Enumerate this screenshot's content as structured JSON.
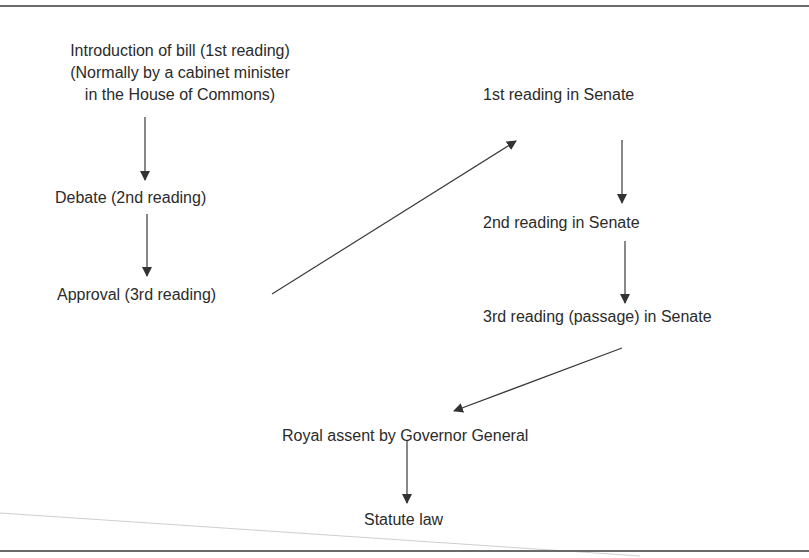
{
  "diagram": {
    "type": "flowchart",
    "nodes": {
      "intro": {
        "line1": "Introduction of bill (1st reading)",
        "line2": "(Normally by a cabinet minister",
        "line3": "in the House of Commons)"
      },
      "debate": "Debate (2nd reading)",
      "approval": "Approval (3rd reading)",
      "senate1": "1st reading in Senate",
      "senate2": "2nd reading in Senate",
      "senate3": "3rd reading (passage) in Senate",
      "assent": "Royal assent by Governor General",
      "statute": "Statute law"
    },
    "edges": [
      {
        "from": "intro",
        "to": "debate"
      },
      {
        "from": "debate",
        "to": "approval"
      },
      {
        "from": "approval",
        "to": "senate1"
      },
      {
        "from": "senate1",
        "to": "senate2"
      },
      {
        "from": "senate2",
        "to": "senate3"
      },
      {
        "from": "senate3",
        "to": "assent"
      },
      {
        "from": "assent",
        "to": "statute"
      }
    ],
    "colors": {
      "text": "#2b2b2b",
      "arrow": "#3a3a3a",
      "rule": "#6a6a6a"
    }
  }
}
